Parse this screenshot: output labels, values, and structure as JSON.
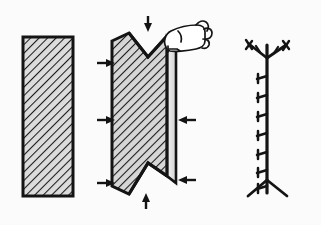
{
  "figure": {
    "title": "Plate forming sequence: flat plate, compressed notched plate with hand, resulting seam line",
    "width": 321,
    "height": 225,
    "background_color": "#fbfbfb",
    "ink_color": "#141414",
    "hatch_color": "#1a1a1a",
    "fill_color": "#d8d8d8",
    "panels": [
      {
        "id": "panel-flat-plate",
        "label": "Flat hatched plate",
        "stage_number": "1",
        "shape": "rectangle",
        "x": 23,
        "y": 37,
        "width": 50,
        "height": 159,
        "hatch_angle_deg": 45,
        "hatch_spacing_px": 6,
        "outline_width_px": 3
      },
      {
        "id": "panel-compressed-plate",
        "label": "Compressed plate with V-notches and gripping hand",
        "stage_number": "2",
        "shape": "notched-slab",
        "notch_top": true,
        "notch_bottom": true,
        "hatch_angle_deg": 45,
        "hatch_spacing_px": 6,
        "outline_width_px": 3,
        "arrows": [
          {
            "name": "arrow-left-top",
            "direction": "right",
            "x": 104,
            "y": 63
          },
          {
            "name": "arrow-left-middle",
            "direction": "right",
            "x": 104,
            "y": 120
          },
          {
            "name": "arrow-left-bottom",
            "direction": "right",
            "x": 104,
            "y": 183
          },
          {
            "name": "arrow-right-middle",
            "direction": "left",
            "x": 186,
            "y": 120
          },
          {
            "name": "arrow-right-bottom",
            "direction": "left",
            "x": 186,
            "y": 180
          },
          {
            "name": "arrow-top-down",
            "direction": "down",
            "x": 148,
            "y": 27
          },
          {
            "name": "arrow-bottom-up",
            "direction": "up",
            "x": 146,
            "y": 198
          }
        ],
        "hand": {
          "name": "hand-grip",
          "label": "Hand gripping top-right corner",
          "x": 160,
          "y": 16,
          "width": 46,
          "height": 36
        }
      },
      {
        "id": "panel-seam-line",
        "label": "Resulting seam line with barbs and forked ends",
        "stage_number": "3",
        "shape": "barbed-vertical-line",
        "x_center": 267,
        "y_top": 42,
        "y_bottom": 196,
        "barb_count": 7,
        "fork_top": true,
        "fork_bottom": true,
        "line_width_px": 3
      }
    ]
  }
}
